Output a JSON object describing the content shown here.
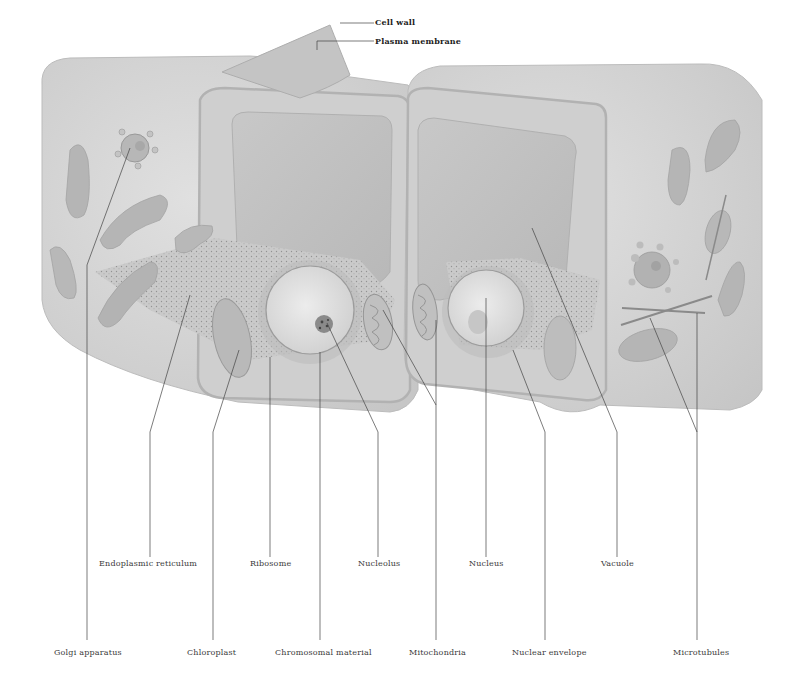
{
  "figure": {
    "colors": {
      "cell_body": "#d4d4d4",
      "cell_face": "#c9c9c9",
      "cell_wall_edge": "#b9b9b9",
      "vacuole": "#bfbfbf",
      "organelle": "#b3b3b3",
      "nucleus": "#dedede",
      "leader_line": "#444444",
      "label_text": "#3a3a3a",
      "background": "#ffffff"
    }
  },
  "labels": {
    "cell_wall": "Cell wall",
    "plasma_membrane": "Plasma membrane",
    "endoplasmic_reticulum": "Endoplasmic reticulum",
    "ribosome": "Ribosome",
    "nucleolus": "Nucleolus",
    "nucleus": "Nucleus",
    "vacuole": "Vacuole",
    "golgi_apparatus": "Golgi apparatus",
    "chloroplast": "Chloroplast",
    "chromosomal_material": "Chromosomal material",
    "mitochondria": "Mitochondria",
    "nuclear_envelope": "Nuclear envelope",
    "microtubules": "Microtubules"
  }
}
